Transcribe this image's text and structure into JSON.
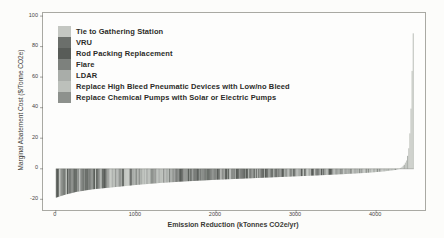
{
  "chart_data": {
    "type": "bar",
    "subtype": "marginal-abatement-cost-curve",
    "title": "",
    "xlabel": "Emission Reduction (kTonnes CO2e/yr)",
    "ylabel": "Marginal Abatement Cost ($/Tonne CO2e)",
    "xlim": [
      -160,
      4610
    ],
    "ylim": [
      -27,
      102
    ],
    "x_ticks": [
      0,
      1000,
      2000,
      3000,
      4000
    ],
    "y_ticks": [
      100,
      80,
      60,
      40,
      20,
      0,
      -20
    ],
    "grid": false,
    "legend_position": "upper-left-inside",
    "legend": [
      {
        "label": "Tie to Gathering Station",
        "color": "#c4c7c2"
      },
      {
        "label": "VRU",
        "color": "#6b6f6b"
      },
      {
        "label": "Rod Packing Replacement",
        "color": "#585c58"
      },
      {
        "label": "Flare",
        "color": "#7d817d"
      },
      {
        "label": "LDAR",
        "color": "#a9ada9"
      },
      {
        "label": "Replace High Bleed Pneumatic Devices with Low/no Bleed",
        "color": "#bcc0bb"
      },
      {
        "label": "Replace Chemical Pumps with Solar or Electric Pumps",
        "color": "#8d918d"
      }
    ],
    "envelope_points_x_kTonnes_y_dollarsPerTonne": [
      [
        0,
        -19
      ],
      [
        100,
        -17.2
      ],
      [
        250,
        -15.2
      ],
      [
        450,
        -13.5
      ],
      [
        700,
        -12.2
      ],
      [
        1000,
        -10.6
      ],
      [
        1300,
        -9.3
      ],
      [
        1600,
        -8.3
      ],
      [
        2000,
        -7.2
      ],
      [
        2400,
        -6.3
      ],
      [
        2800,
        -5.4
      ],
      [
        3200,
        -4.5
      ],
      [
        3600,
        -3.5
      ],
      [
        3900,
        -2.6
      ],
      [
        4100,
        -1.7
      ],
      [
        4250,
        -0.7
      ],
      [
        4310,
        0.6
      ],
      [
        4350,
        2.5
      ],
      [
        4385,
        6
      ],
      [
        4405,
        12
      ],
      [
        4420,
        22
      ],
      [
        4433,
        36
      ],
      [
        4444,
        54
      ],
      [
        4453,
        72
      ],
      [
        4461,
        86
      ],
      [
        4470,
        98
      ]
    ],
    "bar_count": 320,
    "bar_x_max": 4470,
    "baseline_value": 0,
    "baseline_color": "#55585333",
    "color_segments": [
      {
        "from": 0,
        "to": 650,
        "colors": [
          1,
          2,
          6,
          1,
          5,
          1,
          3,
          2
        ]
      },
      {
        "from": 650,
        "to": 1050,
        "colors": [
          5,
          1,
          4,
          6,
          2,
          5,
          4
        ]
      },
      {
        "from": 1050,
        "to": 1500,
        "colors": [
          4,
          5,
          6,
          4,
          5,
          3
        ]
      },
      {
        "from": 1500,
        "to": 2050,
        "colors": [
          2,
          1,
          2,
          3,
          2,
          1,
          6
        ]
      },
      {
        "from": 2050,
        "to": 2950,
        "colors": [
          2,
          3,
          1,
          2,
          6,
          2,
          4
        ]
      },
      {
        "from": 2950,
        "to": 3450,
        "colors": [
          6,
          4,
          2,
          5,
          6,
          1,
          4
        ]
      },
      {
        "from": 3450,
        "to": 3950,
        "colors": [
          4,
          6,
          5,
          4,
          3,
          6
        ]
      },
      {
        "from": 3950,
        "to": 4290,
        "colors": [
          4,
          5,
          6,
          5,
          4,
          5
        ]
      },
      {
        "from": 4290,
        "to": 4471,
        "colors": [
          0,
          0,
          0,
          4,
          0
        ]
      }
    ],
    "axis_color": "#a9a9a3",
    "tick_color": "#6a6a64"
  }
}
